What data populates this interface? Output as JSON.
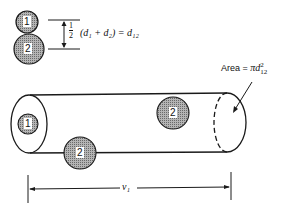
{
  "diagram": {
    "molecules": {
      "one_label": "1",
      "two_label": "2"
    },
    "separation_formula": {
      "fraction_num": "1",
      "fraction_den": "2",
      "expression": "(d₁ + d₂) = d₁₂"
    },
    "area_formula": {
      "label": "Area =",
      "expression": "πd",
      "superscript": "2",
      "subscript": "12"
    },
    "length_label": "v₁",
    "colors": {
      "stroke": "#1a1a1a",
      "molecule_fill": "#9a9a9a",
      "background": "#ffffff"
    }
  }
}
